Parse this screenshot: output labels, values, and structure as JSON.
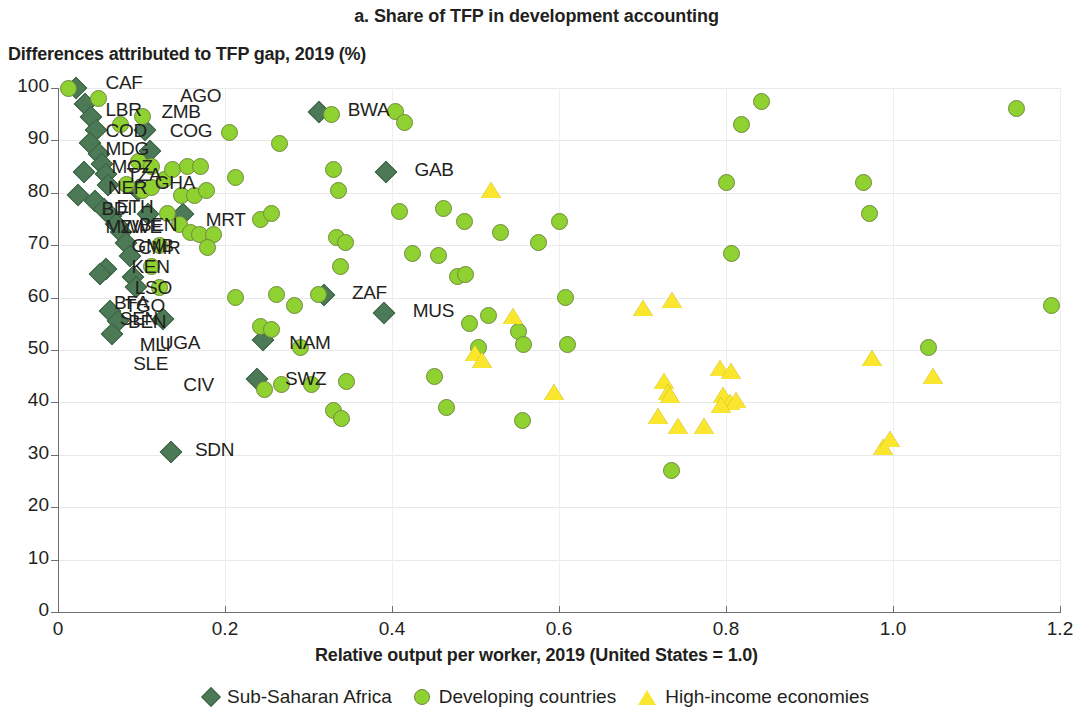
{
  "chart_data": {
    "type": "scatter",
    "title": "a. Share of TFP in development accounting",
    "ylabel": "Differences attributed to TFP gap, 2019 (%)",
    "xlabel": "Relative output per worker, 2019 (United States = 1.0)",
    "xlim": [
      0,
      1.2
    ],
    "ylim": [
      0,
      100
    ],
    "xticks": [
      "0",
      "0.2",
      "0.4",
      "0.6",
      "0.8",
      "1.0",
      "1.2"
    ],
    "xtick_values": [
      0,
      0.2,
      0.4,
      0.6,
      0.8,
      1.0,
      1.2
    ],
    "yticks": [
      "0",
      "10",
      "20",
      "30",
      "40",
      "50",
      "60",
      "70",
      "80",
      "90",
      "100"
    ],
    "ytick_values": [
      0,
      10,
      20,
      30,
      40,
      50,
      60,
      70,
      80,
      90,
      100
    ],
    "grid": true,
    "legend_position": "bottom",
    "colors": {
      "sub_saharan_africa": "#4c7a56",
      "developing_countries": "#8fd130",
      "high_income_economies": "#fbe62e",
      "axis": "#6d6e70",
      "grid": "#e9e9ea",
      "text": "#231f20"
    },
    "legend": [
      {
        "label": "Sub-Saharan Africa",
        "marker": "diamond",
        "color": "#4c7a56"
      },
      {
        "label": "Developing countries",
        "marker": "circle",
        "color": "#8fd130"
      },
      {
        "label": "High-income economies",
        "marker": "triangle",
        "color": "#fbe62e"
      }
    ],
    "series": [
      {
        "name": "Sub-Saharan Africa",
        "marker": "diamond",
        "color": "#4c7a56",
        "points": [
          {
            "x": 0.022,
            "y": 100.0,
            "label": "CAF"
          },
          {
            "x": 0.032,
            "y": 97.0
          },
          {
            "x": 0.04,
            "y": 94.5
          },
          {
            "x": 0.046,
            "y": 92.0
          },
          {
            "x": 0.038,
            "y": 89.5
          },
          {
            "x": 0.049,
            "y": 87.5
          },
          {
            "x": 0.053,
            "y": 85.5
          },
          {
            "x": 0.058,
            "y": 83.5
          },
          {
            "x": 0.031,
            "y": 84.0
          },
          {
            "x": 0.06,
            "y": 81.5
          },
          {
            "x": 0.024,
            "y": 79.5
          },
          {
            "x": 0.044,
            "y": 78.5
          },
          {
            "x": 0.055,
            "y": 77.0
          },
          {
            "x": 0.063,
            "y": 75.5
          },
          {
            "x": 0.07,
            "y": 74.0
          },
          {
            "x": 0.076,
            "y": 72.5
          },
          {
            "x": 0.082,
            "y": 70.5
          },
          {
            "x": 0.086,
            "y": 68.0
          },
          {
            "x": 0.058,
            "y": 65.5
          },
          {
            "x": 0.05,
            "y": 64.5
          },
          {
            "x": 0.09,
            "y": 64.0
          },
          {
            "x": 0.093,
            "y": 62.0
          },
          {
            "x": 0.062,
            "y": 57.5
          },
          {
            "x": 0.072,
            "y": 55.5
          },
          {
            "x": 0.065,
            "y": 53.0,
            "label": "SLE"
          },
          {
            "x": 0.104,
            "y": 92.0,
            "label": "AGO"
          },
          {
            "x": 0.11,
            "y": 88.0
          },
          {
            "x": 0.096,
            "y": 80.5
          },
          {
            "x": 0.108,
            "y": 76.0
          },
          {
            "x": 0.15,
            "y": 76.0,
            "label": "MRT"
          },
          {
            "x": 0.126,
            "y": 56.0,
            "label": "MLI"
          },
          {
            "x": 0.135,
            "y": 30.5,
            "label": "SDN"
          },
          {
            "x": 0.245,
            "y": 52.0,
            "label": "NAM"
          },
          {
            "x": 0.238,
            "y": 44.5,
            "label": "SWZ"
          },
          {
            "x": 0.312,
            "y": 95.5,
            "label": "BWA"
          },
          {
            "x": 0.393,
            "y": 84.0,
            "label": "GAB"
          },
          {
            "x": 0.319,
            "y": 60.5,
            "label": "ZAF"
          },
          {
            "x": 0.391,
            "y": 57.0,
            "label": "MUS"
          }
        ]
      },
      {
        "name": "Developing countries",
        "marker": "circle",
        "color": "#8fd130",
        "points": [
          {
            "x": 0.012,
            "y": 100.0
          },
          {
            "x": 0.048,
            "y": 98.0
          },
          {
            "x": 0.075,
            "y": 93.0
          },
          {
            "x": 0.101,
            "y": 94.5
          },
          {
            "x": 0.097,
            "y": 86.0
          },
          {
            "x": 0.112,
            "y": 85.0
          },
          {
            "x": 0.082,
            "y": 81.5
          },
          {
            "x": 0.101,
            "y": 80.5
          },
          {
            "x": 0.112,
            "y": 81.0
          },
          {
            "x": 0.128,
            "y": 82.5
          },
          {
            "x": 0.137,
            "y": 84.5
          },
          {
            "x": 0.155,
            "y": 85.0
          },
          {
            "x": 0.171,
            "y": 85.0
          },
          {
            "x": 0.148,
            "y": 79.5
          },
          {
            "x": 0.163,
            "y": 79.5
          },
          {
            "x": 0.178,
            "y": 80.5
          },
          {
            "x": 0.131,
            "y": 76.0
          },
          {
            "x": 0.146,
            "y": 74.0
          },
          {
            "x": 0.159,
            "y": 72.5
          },
          {
            "x": 0.17,
            "y": 72.0
          },
          {
            "x": 0.186,
            "y": 72.0
          },
          {
            "x": 0.179,
            "y": 69.5
          },
          {
            "x": 0.121,
            "y": 70.0
          },
          {
            "x": 0.112,
            "y": 66.0
          },
          {
            "x": 0.121,
            "y": 62.0
          },
          {
            "x": 0.205,
            "y": 91.5
          },
          {
            "x": 0.213,
            "y": 83.0
          },
          {
            "x": 0.213,
            "y": 60.0
          },
          {
            "x": 0.243,
            "y": 75.0
          },
          {
            "x": 0.256,
            "y": 76.0
          },
          {
            "x": 0.265,
            "y": 89.5
          },
          {
            "x": 0.262,
            "y": 60.5
          },
          {
            "x": 0.243,
            "y": 54.5
          },
          {
            "x": 0.256,
            "y": 54.0
          },
          {
            "x": 0.247,
            "y": 42.5
          },
          {
            "x": 0.283,
            "y": 58.5
          },
          {
            "x": 0.291,
            "y": 50.5
          },
          {
            "x": 0.268,
            "y": 43.5
          },
          {
            "x": 0.303,
            "y": 43.5
          },
          {
            "x": 0.33,
            "y": 84.5
          },
          {
            "x": 0.336,
            "y": 80.5
          },
          {
            "x": 0.334,
            "y": 71.5
          },
          {
            "x": 0.344,
            "y": 70.5
          },
          {
            "x": 0.338,
            "y": 66.0
          },
          {
            "x": 0.327,
            "y": 95.0
          },
          {
            "x": 0.312,
            "y": 60.5
          },
          {
            "x": 0.33,
            "y": 38.5
          },
          {
            "x": 0.34,
            "y": 37.0
          },
          {
            "x": 0.345,
            "y": 44.0
          },
          {
            "x": 0.404,
            "y": 95.5
          },
          {
            "x": 0.415,
            "y": 93.5
          },
          {
            "x": 0.409,
            "y": 76.5
          },
          {
            "x": 0.425,
            "y": 68.5
          },
          {
            "x": 0.451,
            "y": 45.0
          },
          {
            "x": 0.456,
            "y": 68.0
          },
          {
            "x": 0.462,
            "y": 77.0
          },
          {
            "x": 0.465,
            "y": 39.0
          },
          {
            "x": 0.478,
            "y": 64.0
          },
          {
            "x": 0.487,
            "y": 74.5
          },
          {
            "x": 0.488,
            "y": 64.5
          },
          {
            "x": 0.493,
            "y": 55.0
          },
          {
            "x": 0.503,
            "y": 50.5
          },
          {
            "x": 0.515,
            "y": 56.5
          },
          {
            "x": 0.53,
            "y": 72.5
          },
          {
            "x": 0.552,
            "y": 53.5
          },
          {
            "x": 0.558,
            "y": 51.0
          },
          {
            "x": 0.556,
            "y": 36.5
          },
          {
            "x": 0.575,
            "y": 70.5
          },
          {
            "x": 0.6,
            "y": 74.5
          },
          {
            "x": 0.608,
            "y": 60.0
          },
          {
            "x": 0.61,
            "y": 51.0
          },
          {
            "x": 0.735,
            "y": 27.0
          },
          {
            "x": 0.8,
            "y": 82.0
          },
          {
            "x": 0.806,
            "y": 68.5
          },
          {
            "x": 0.818,
            "y": 93.0
          },
          {
            "x": 0.843,
            "y": 97.5
          },
          {
            "x": 0.965,
            "y": 82.0
          },
          {
            "x": 0.972,
            "y": 76.0
          },
          {
            "x": 1.043,
            "y": 50.5
          },
          {
            "x": 1.148,
            "y": 96.0
          },
          {
            "x": 1.19,
            "y": 58.5
          }
        ]
      },
      {
        "name": "High-income economies",
        "marker": "triangle",
        "color": "#fbe62e",
        "points": [
          {
            "x": 0.519,
            "y": 80.5
          },
          {
            "x": 0.499,
            "y": 49.5
          },
          {
            "x": 0.508,
            "y": 48.0
          },
          {
            "x": 0.545,
            "y": 56.5
          },
          {
            "x": 0.594,
            "y": 42.0
          },
          {
            "x": 0.7,
            "y": 58.0
          },
          {
            "x": 0.735,
            "y": 59.5
          },
          {
            "x": 0.726,
            "y": 44.0
          },
          {
            "x": 0.73,
            "y": 42.0
          },
          {
            "x": 0.733,
            "y": 41.5
          },
          {
            "x": 0.719,
            "y": 37.5
          },
          {
            "x": 0.743,
            "y": 35.5
          },
          {
            "x": 0.774,
            "y": 35.5
          },
          {
            "x": 0.793,
            "y": 46.5
          },
          {
            "x": 0.806,
            "y": 46.0
          },
          {
            "x": 0.797,
            "y": 41.5
          },
          {
            "x": 0.805,
            "y": 40.0
          },
          {
            "x": 0.812,
            "y": 40.5
          },
          {
            "x": 0.794,
            "y": 39.5
          },
          {
            "x": 0.975,
            "y": 48.5
          },
          {
            "x": 1.048,
            "y": 45.0
          },
          {
            "x": 0.988,
            "y": 31.5
          },
          {
            "x": 0.997,
            "y": 33.0
          }
        ]
      }
    ],
    "point_labels": [
      {
        "text": "CAF",
        "x": 0.045,
        "y": 100.5
      },
      {
        "text": "AGO",
        "x": 0.134,
        "y": 98.0
      },
      {
        "text": "LBR",
        "x": 0.045,
        "y": 95.5
      },
      {
        "text": "ZMB",
        "x": 0.112,
        "y": 95.0
      },
      {
        "text": "COD",
        "x": 0.045,
        "y": 91.5
      },
      {
        "text": "COG",
        "x": 0.122,
        "y": 91.5
      },
      {
        "text": "MDG",
        "x": 0.045,
        "y": 88.0
      },
      {
        "text": "MOZ",
        "x": 0.052,
        "y": 84.5
      },
      {
        "text": "TZA",
        "x": 0.07,
        "y": 83.0
      },
      {
        "text": "NER",
        "x": 0.048,
        "y": 80.5
      },
      {
        "text": "GHA",
        "x": 0.104,
        "y": 81.5
      },
      {
        "text": "BDI",
        "x": 0.04,
        "y": 76.5
      },
      {
        "text": "ETH",
        "x": 0.058,
        "y": 77.0
      },
      {
        "text": "MWI",
        "x": 0.045,
        "y": 73.0
      },
      {
        "text": "ZWE",
        "x": 0.063,
        "y": 73.0
      },
      {
        "text": "BEN",
        "x": 0.085,
        "y": 73.5
      },
      {
        "text": "GMB",
        "x": 0.076,
        "y": 69.5
      },
      {
        "text": "CMR",
        "x": 0.084,
        "y": 69.0
      },
      {
        "text": "MRT",
        "x": 0.165,
        "y": 74.5
      },
      {
        "text": "KEN",
        "x": 0.076,
        "y": 65.5
      },
      {
        "text": "LSO",
        "x": 0.08,
        "y": 61.5
      },
      {
        "text": "BFA",
        "x": 0.055,
        "y": 58.5
      },
      {
        "text": "TGO",
        "x": 0.068,
        "y": 58.0
      },
      {
        "text": "SEN",
        "x": 0.062,
        "y": 55.5
      },
      {
        "text": "BEN",
        "x": 0.072,
        "y": 55.0
      },
      {
        "text": "MLI",
        "x": 0.086,
        "y": 50.5
      },
      {
        "text": "UGA",
        "x": 0.11,
        "y": 51.0
      },
      {
        "text": "SLE",
        "x": 0.078,
        "y": 47.0
      },
      {
        "text": "CIV",
        "x": 0.138,
        "y": 43.0
      },
      {
        "text": "SDN",
        "x": 0.152,
        "y": 30.5
      },
      {
        "text": "BWA",
        "x": 0.335,
        "y": 95.5
      },
      {
        "text": "GAB",
        "x": 0.415,
        "y": 84.0
      },
      {
        "text": "ZAF",
        "x": 0.34,
        "y": 60.5
      },
      {
        "text": "MUS",
        "x": 0.413,
        "y": 57.0
      },
      {
        "text": "NAM",
        "x": 0.265,
        "y": 51.0
      },
      {
        "text": "SWZ",
        "x": 0.26,
        "y": 44.0
      }
    ]
  }
}
